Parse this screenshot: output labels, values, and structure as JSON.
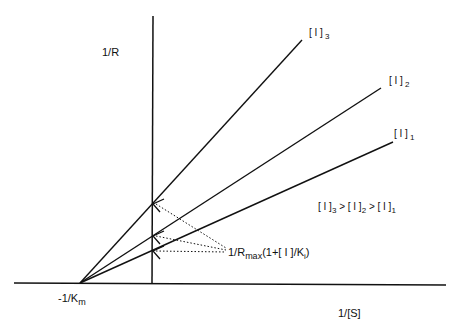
{
  "diagram": {
    "type": "Lineweaver-Burk plot (competitive inhibition)",
    "y_axis_label": "1/R",
    "x_axis_label": "1/[S]",
    "x_intercept_label": "-1/K",
    "x_intercept_sub": "m",
    "lines": [
      {
        "id": "I3",
        "label": "[ I ]",
        "sub": "3"
      },
      {
        "id": "I2",
        "label": "[ I ]",
        "sub": "2"
      },
      {
        "id": "I1",
        "label": "[ I ]",
        "sub": "1"
      }
    ],
    "order_relation": {
      "parts": [
        "[ I ]",
        "3",
        " > [ I ]",
        "2",
        " > [ I ]",
        "1"
      ]
    },
    "intercept_annotation": {
      "prefix": "1/R",
      "sub1": "max",
      "middle": "(1+[ I ]/K",
      "sub2": "i",
      "suffix": ")"
    },
    "colors": {
      "ink": "#111111",
      "background": "#ffffff"
    }
  }
}
